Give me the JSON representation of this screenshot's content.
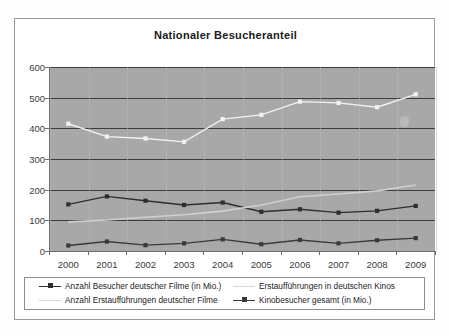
{
  "chart": {
    "title": "Nationaler Besucheranteil"
  },
  "chart_data": {
    "type": "line",
    "title": "Nationaler Besucheranteil",
    "xlabel": "",
    "ylabel": "",
    "categories": [
      "2000",
      "2001",
      "2002",
      "2003",
      "2004",
      "2005",
      "2006",
      "2007",
      "2008",
      "2009"
    ],
    "ylim": [
      0,
      600
    ],
    "yticks": [
      0,
      100,
      200,
      300,
      400,
      500,
      600
    ],
    "ytick_labels": [
      "0",
      "100",
      "200",
      "300",
      "400",
      "500",
      "600"
    ],
    "grid": true,
    "legend_position": "bottom",
    "series": [
      {
        "name": "Anzahl Besucher deutscher Filme (in Mio.)",
        "color": "#2e2e2e",
        "marker": "square",
        "values": [
          152,
          178,
          164,
          150,
          158,
          128,
          136,
          125,
          131,
          147
        ]
      },
      {
        "name": "Erstaufführungen in deutschen Kinos",
        "color": "#d0d0d0",
        "marker": "none",
        "values": [
          95,
          101,
          110,
          118,
          130,
          150,
          177,
          186,
          196,
          215
        ]
      },
      {
        "name": "Anzahl Erstaufführungen deutscher Filme",
        "color": "#3a3a3a",
        "marker": "square",
        "values": [
          18,
          31,
          19,
          25,
          38,
          22,
          36,
          25,
          35,
          42
        ]
      },
      {
        "name": "Kinobesucher gesamt (in Mio.)",
        "color": "#f2f2f2",
        "marker": "square",
        "values": [
          415,
          373,
          367,
          356,
          430,
          444,
          487,
          483,
          469,
          511
        ]
      }
    ]
  },
  "legend": {
    "items": [
      {
        "label": "Anzahl Besucher deutscher Filme (in Mio.)",
        "color": "#2e2e2e",
        "marker": true
      },
      {
        "label": "Erstaufführungen in deutschen Kinos",
        "color": "#d7d7d7",
        "marker": false
      },
      {
        "label": "Anzahl Erstaufführungen deutscher Filme",
        "color": "#d7d7d7",
        "marker": false
      },
      {
        "label": "Kinobesucher gesamt (in Mio.)",
        "color": "#3a3a3a",
        "marker": true
      }
    ]
  }
}
